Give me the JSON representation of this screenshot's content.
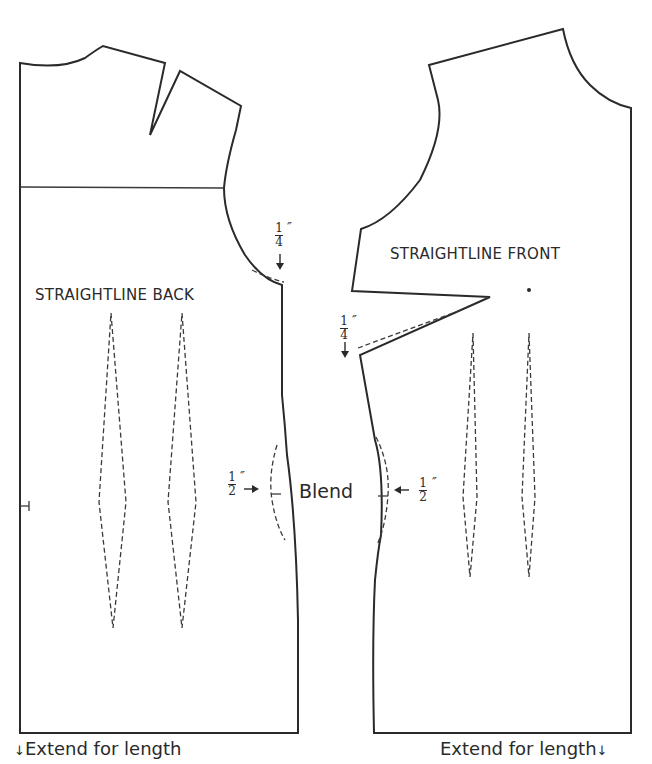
{
  "back_piece": {
    "title": "STRAIGHTLINE BACK",
    "armhole_adjustment": {
      "numerator": "1",
      "denominator": "4",
      "unit": "″"
    },
    "waist_adjustment": {
      "numerator": "1",
      "denominator": "2",
      "unit": "″"
    }
  },
  "front_piece": {
    "title": "STRAIGHTLINE FRONT",
    "dart_adjustment": {
      "numerator": "1",
      "denominator": "4",
      "unit": "″"
    },
    "waist_adjustment": {
      "numerator": "1",
      "denominator": "2",
      "unit": "″"
    }
  },
  "center_label": "Blend",
  "footer": {
    "left": "Extend for length",
    "right": "Extend for length",
    "arrow_glyph": "↓"
  }
}
